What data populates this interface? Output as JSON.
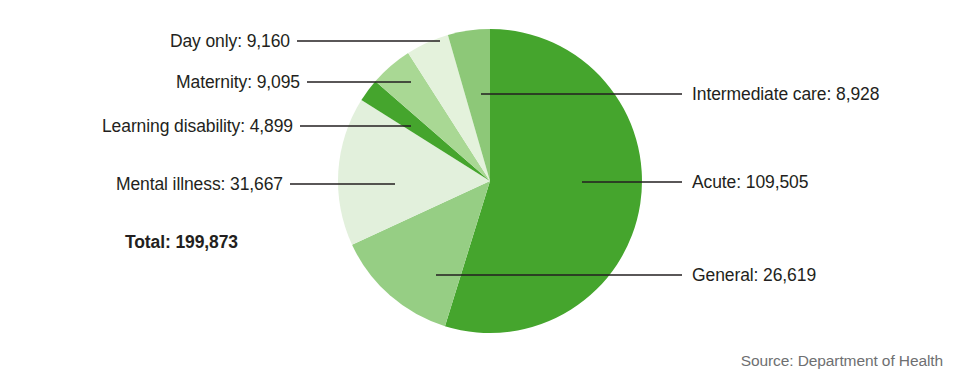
{
  "chart_data": {
    "type": "pie",
    "title": "",
    "subtitle": "",
    "unit": "beds",
    "total_label": "Total:",
    "total_value": "199,873",
    "total_numeric": 199873,
    "source": "Source: Department of Health",
    "legend_position": "callout-labels",
    "grid": false,
    "start_angle_deg": 0,
    "direction": "clockwise",
    "categories": [
      "Acute",
      "General",
      "Mental illness",
      "Learning disability",
      "Maternity",
      "Day only",
      "Intermediate care"
    ],
    "values": [
      109505,
      26619,
      31667,
      4899,
      9095,
      9160,
      8928
    ],
    "labels": [
      "Acute: 109,505",
      "General: 26,619",
      "Mental illness: 31,667",
      "Learning disability: 4,899",
      "Maternity: 9,095",
      "Day only: 9,160",
      "Intermediate care: 8,928"
    ],
    "colors": [
      "#45a52d",
      "#96ce84",
      "#e2f0dc",
      "#45a52d",
      "#a9d894",
      "#e4f2dc",
      "#8dc878"
    ],
    "slices": [
      {
        "name": "Acute",
        "label": "Acute: 109,505",
        "value": 109505,
        "color": "#45a52d",
        "side": "right"
      },
      {
        "name": "General",
        "label": "General: 26,619",
        "value": 26619,
        "color": "#96ce84",
        "side": "right"
      },
      {
        "name": "Mental illness",
        "label": "Mental illness: 31,667",
        "value": 31667,
        "color": "#e2f0dc",
        "side": "left"
      },
      {
        "name": "Learning disability",
        "label": "Learning disability: 4,899",
        "value": 4899,
        "color": "#45a52d",
        "side": "left"
      },
      {
        "name": "Maternity",
        "label": "Maternity: 9,095",
        "value": 9095,
        "color": "#a9d894",
        "side": "left"
      },
      {
        "name": "Day only",
        "label": "Day only: 9,160",
        "value": 9160,
        "color": "#e4f2dc",
        "side": "left"
      },
      {
        "name": "Intermediate care",
        "label": "Intermediate care: 8,928",
        "value": 8928,
        "color": "#8dc878",
        "side": "right"
      }
    ]
  },
  "callouts": {
    "day_only": "Day only: 9,160",
    "maternity": "Maternity: 9,095",
    "learning_disability": "Learning disability: 4,899",
    "mental_illness": "Mental illness: 31,667",
    "total": "Total: 199,873",
    "intermediate_care": "Intermediate care: 8,928",
    "acute": "Acute: 109,505",
    "general": "General: 26,619"
  },
  "footer": {
    "source": "Source: Department of Health"
  },
  "geometry": {
    "center_x": 490,
    "center_y": 181,
    "radius": 152
  }
}
